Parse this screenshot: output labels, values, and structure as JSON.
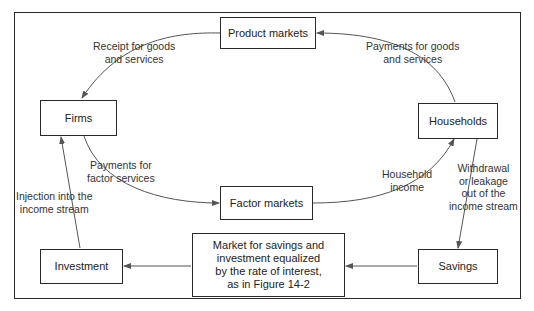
{
  "diagram": {
    "type": "circular-flow",
    "nodes": {
      "product_markets": "Product markets",
      "firms": "Firms",
      "households": "Households",
      "factor_markets": "Factor markets",
      "investment": "Investment",
      "savings_market": "Market for savings and investment equalized by the rate of interest, as in Figure 14-2",
      "savings": "Savings"
    },
    "savings_market_lines": [
      "Market for savings and",
      "investment equalized",
      "by the rate of interest,",
      "as in Figure 14-2"
    ],
    "edges": [
      {
        "from": "product_markets",
        "to": "firms",
        "label_lines": [
          "Receipt for goods",
          "and services"
        ]
      },
      {
        "from": "households",
        "to": "product_markets",
        "label_lines": [
          "Payments for goods",
          "and services"
        ]
      },
      {
        "from": "firms",
        "to": "factor_markets",
        "label_lines": [
          "Payments for",
          "factor services"
        ]
      },
      {
        "from": "factor_markets",
        "to": "households",
        "label_lines": [
          "Household",
          "income"
        ]
      },
      {
        "from": "households",
        "to": "savings",
        "label_lines": [
          "Withdrawal",
          "or leakage",
          "out of the",
          "income stream"
        ]
      },
      {
        "from": "savings",
        "to": "savings_market",
        "label_lines": []
      },
      {
        "from": "savings_market",
        "to": "investment",
        "label_lines": []
      },
      {
        "from": "investment",
        "to": "firms",
        "label_lines": [
          "Injection into the",
          "income stream"
        ]
      }
    ],
    "line_color": "#555555",
    "border_color": "#2a2a2a"
  }
}
